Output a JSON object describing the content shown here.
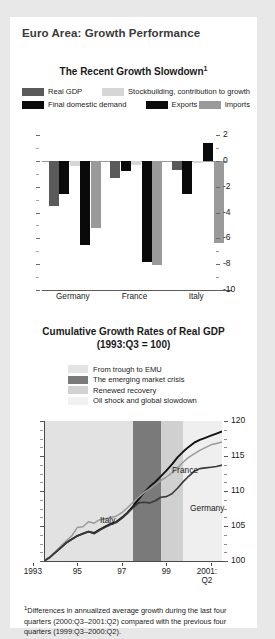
{
  "panel": {
    "title": "Euro Area: Growth Performance"
  },
  "chart1": {
    "title": "The Recent Growth Slowdown",
    "title_sup": "1",
    "legend": [
      {
        "label": "Real GDP",
        "color": "#5a5a5a"
      },
      {
        "label": "Stockbuilding, contribution to growth",
        "color": "#d6d6d6"
      },
      {
        "label": "Final domestic demand",
        "color": "#0a0a0a"
      },
      {
        "label": "Exports",
        "color": "#0a0a0a"
      },
      {
        "label": "Imports",
        "color": "#9a9a9a"
      }
    ],
    "yticks": [
      "2",
      "0",
      "-2",
      "-4",
      "-6",
      "-8",
      "-10"
    ],
    "xlabels": [
      "Germany",
      "France",
      "Italy"
    ]
  },
  "chart2": {
    "title_line1": "Cumulative Growth Rates of Real GDP",
    "title_line2": "(1993:Q3 = 100)",
    "legend": [
      {
        "label": "From trough to EMU",
        "color": "#e2e2e2"
      },
      {
        "label": "The emerging market crisis",
        "color": "#7a7a7a"
      },
      {
        "label": "Renewed recovery",
        "color": "#d0d0d0"
      },
      {
        "label": "Oil shock and global slowdown",
        "color": "#efefef"
      }
    ],
    "yticks": [
      "120",
      "115",
      "110",
      "105",
      "100"
    ],
    "xlabels": [
      "1993",
      "95",
      "97",
      "99",
      "2001:"
    ],
    "xlabel_last_sub": "Q2",
    "series_labels": {
      "france": "France",
      "germany": "Germany",
      "italy": "Italy"
    }
  },
  "footnote": {
    "marker": "1",
    "text": "Differences in annualized average growth during the last four quarters (2000:Q3–2001:Q2) compared with the previous four quarters (1999:Q3–2000:Q2)."
  },
  "chart_data": [
    {
      "type": "bar",
      "title": "The Recent Growth Slowdown",
      "subtitle": "Differences in annualized average growth, 2000:Q3-2001:Q2 vs 1999:Q3-2000:Q2",
      "categories": [
        "Germany",
        "France",
        "Italy"
      ],
      "series": [
        {
          "name": "Real GDP",
          "color": "#5a5a5a",
          "values": [
            -3.5,
            -1.3,
            -0.7
          ]
        },
        {
          "name": "Final domestic demand",
          "color": "#0a0a0a",
          "values": [
            -2.6,
            -0.8,
            -2.6
          ]
        },
        {
          "name": "Stockbuilding, contribution to growth",
          "color": "#d6d6d6",
          "values": [
            -0.4,
            -0.3,
            -0.2
          ]
        },
        {
          "name": "Exports",
          "color": "#0a0a0a",
          "values": [
            -6.5,
            -7.8,
            1.4
          ]
        },
        {
          "name": "Imports",
          "color": "#9a9a9a",
          "values": [
            -5.2,
            -8.1,
            -6.4
          ]
        }
      ],
      "xlabel": "",
      "ylabel": "",
      "ylim": [
        -10,
        2
      ],
      "ytick_step": 2,
      "grid": false,
      "legend_position": "top"
    },
    {
      "type": "line",
      "title": "Cumulative Growth Rates of Real GDP (1993:Q3 = 100)",
      "xlabel": "",
      "ylabel": "",
      "xlim": [
        1993.5,
        2001.5
      ],
      "ylim": [
        100,
        120
      ],
      "ytick_step": 5,
      "xticks": [
        1993,
        1995,
        1997,
        1999,
        2001
      ],
      "xtick_labels": [
        "1993",
        "95",
        "97",
        "99",
        "2001:Q2"
      ],
      "grid": false,
      "legend_position": "above-plot",
      "shaded_bands": [
        {
          "name": "From trough to EMU",
          "color": "#e2e2e2",
          "x_start": 1993.5,
          "x_end": 1997.5
        },
        {
          "name": "The emerging market crisis",
          "color": "#7a7a7a",
          "x_start": 1997.5,
          "x_end": 1998.75
        },
        {
          "name": "Renewed recovery",
          "color": "#d0d0d0",
          "x_start": 1998.75,
          "x_end": 1999.75
        },
        {
          "name": "Oil shock and global slowdown",
          "color": "#efefef",
          "x_start": 1999.75,
          "x_end": 2001.5
        }
      ],
      "series": [
        {
          "name": "France",
          "color": "#111111",
          "x": [
            1993.5,
            1993.75,
            1994.0,
            1994.25,
            1994.5,
            1994.75,
            1995.0,
            1995.25,
            1995.5,
            1995.75,
            1996.0,
            1996.25,
            1996.5,
            1996.75,
            1997.0,
            1997.25,
            1997.5,
            1997.75,
            1998.0,
            1998.25,
            1998.5,
            1998.75,
            1999.0,
            1999.25,
            1999.5,
            1999.75,
            2000.0,
            2000.25,
            2000.5,
            2000.75,
            2001.0,
            2001.25,
            2001.5
          ],
          "values": [
            100.0,
            100.5,
            101.2,
            101.9,
            102.6,
            103.1,
            103.6,
            103.9,
            104.2,
            104.0,
            104.5,
            104.9,
            105.3,
            105.6,
            106.2,
            106.9,
            107.8,
            108.8,
            109.8,
            110.6,
            111.3,
            112.1,
            112.9,
            113.8,
            114.8,
            115.6,
            116.3,
            116.9,
            117.3,
            117.6,
            117.9,
            118.2,
            118.5
          ]
        },
        {
          "name": "Italy",
          "color": "#9a9a9a",
          "x": [
            1993.5,
            1993.75,
            1994.0,
            1994.25,
            1994.5,
            1994.75,
            1995.0,
            1995.25,
            1995.5,
            1995.75,
            1996.0,
            1996.25,
            1996.5,
            1996.75,
            1997.0,
            1997.25,
            1997.5,
            1997.75,
            1998.0,
            1998.25,
            1998.5,
            1998.75,
            1999.0,
            1999.25,
            1999.5,
            1999.75,
            2000.0,
            2000.25,
            2000.5,
            2000.75,
            2001.0,
            2001.25,
            2001.5
          ],
          "values": [
            100.0,
            100.6,
            101.3,
            102.1,
            102.9,
            103.6,
            104.8,
            104.9,
            105.6,
            105.4,
            105.9,
            106.0,
            106.2,
            106.4,
            106.9,
            107.6,
            108.4,
            109.1,
            109.8,
            110.3,
            110.9,
            111.5,
            112.0,
            112.6,
            113.3,
            114.1,
            114.8,
            115.3,
            115.8,
            116.2,
            116.6,
            116.8,
            117.0
          ]
        },
        {
          "name": "Germany",
          "color": "#3a3a3a",
          "x": [
            1993.5,
            1993.75,
            1994.0,
            1994.25,
            1994.5,
            1994.75,
            1995.0,
            1995.25,
            1995.5,
            1995.75,
            1996.0,
            1996.25,
            1996.5,
            1996.75,
            1997.0,
            1997.25,
            1997.5,
            1997.75,
            1998.0,
            1998.25,
            1998.5,
            1998.75,
            1999.0,
            1999.25,
            1999.5,
            1999.75,
            2000.0,
            2000.25,
            2000.5,
            2000.75,
            2001.0,
            2001.25,
            2001.5
          ],
          "values": [
            100.0,
            100.5,
            101.2,
            101.9,
            102.6,
            103.1,
            103.6,
            103.9,
            104.2,
            103.9,
            104.4,
            104.8,
            105.2,
            105.5,
            106.1,
            106.8,
            107.6,
            108.3,
            108.4,
            108.3,
            108.6,
            109.1,
            109.2,
            109.6,
            110.4,
            111.3,
            112.1,
            112.8,
            113.2,
            113.3,
            113.4,
            113.5,
            113.7
          ]
        }
      ]
    }
  ]
}
